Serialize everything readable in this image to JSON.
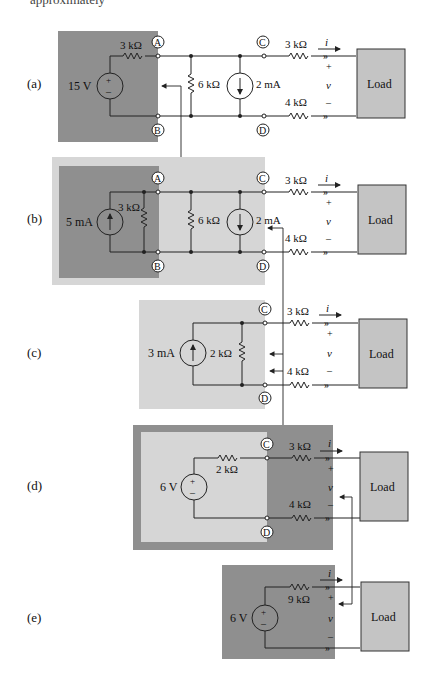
{
  "top_text": "approximately",
  "colors": {
    "dark_gray": "#8f8f8f",
    "mid_gray": "#b5b5b5",
    "light_gray": "#d6d6d6",
    "load_fill": "#c4c4c4",
    "wire": "#222222"
  },
  "common": {
    "load_label": "Load",
    "current_label": "i",
    "voltage_label": "v",
    "plus": "+",
    "minus": "–",
    "r_top": "3 kΩ",
    "r_bottom": "4 kΩ"
  },
  "panels": [
    {
      "id": "a",
      "label": "(a)",
      "source": "15 V",
      "source_type": "voltage",
      "series_resistor": "3 kΩ",
      "shunt_resistor": "6 kΩ",
      "current_source": "2 mA",
      "nodes": [
        "A",
        "B",
        "C",
        "D"
      ]
    },
    {
      "id": "b",
      "label": "(b)",
      "source": "5 mA",
      "source_type": "current",
      "parallel_resistor": "3 kΩ",
      "shunt_resistor": "6 kΩ",
      "current_source": "2 mA",
      "nodes": [
        "A",
        "B",
        "C",
        "D"
      ]
    },
    {
      "id": "c",
      "label": "(c)",
      "source": "3 mA",
      "source_type": "current",
      "parallel_resistor": "2 kΩ",
      "nodes": [
        "C",
        "D"
      ]
    },
    {
      "id": "d",
      "label": "(d)",
      "source": "6 V",
      "source_type": "voltage",
      "series_resistor": "2 kΩ",
      "nodes": [
        "C",
        "D"
      ]
    },
    {
      "id": "e",
      "label": "(e)",
      "source": "6 V",
      "source_type": "voltage",
      "series_resistor": "9 kΩ",
      "nodes": []
    }
  ]
}
